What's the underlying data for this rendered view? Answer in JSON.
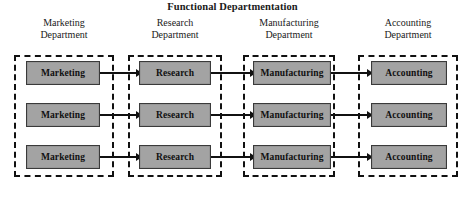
{
  "title": "Functional Departmentation",
  "columns": [
    {
      "id": "marketing",
      "header_line1": "Marketing",
      "header_line2": "Department",
      "unit_label": "Marketing",
      "container_left": 14,
      "container_width": 100,
      "unit_left": 26,
      "unit_width": 74,
      "header_left": 14,
      "header_width": 100,
      "has_outgoing_arrow": true,
      "arrow_left": 100,
      "arrow_width": 42
    },
    {
      "id": "research",
      "header_line1": "Research",
      "header_line2": "Department",
      "unit_label": "Research",
      "container_left": 128,
      "container_width": 94,
      "unit_left": 139,
      "unit_width": 72,
      "header_left": 125,
      "header_width": 100,
      "has_outgoing_arrow": true,
      "arrow_left": 211,
      "arrow_width": 45
    },
    {
      "id": "manufacturing",
      "header_line1": "Manufacturing",
      "header_line2": "Department",
      "unit_label": "Manufacturing",
      "container_left": 243,
      "container_width": 92,
      "unit_left": 253,
      "unit_width": 78,
      "header_left": 239,
      "header_width": 100,
      "has_outgoing_arrow": true,
      "arrow_left": 331,
      "arrow_width": 42
    },
    {
      "id": "accounting",
      "header_line1": "Accounting",
      "header_line2": "Department",
      "unit_label": "Accounting",
      "container_left": 358,
      "container_width": 100,
      "unit_left": 371,
      "unit_width": 76,
      "header_left": 358,
      "header_width": 100,
      "has_outgoing_arrow": false,
      "arrow_left": 0,
      "arrow_width": 0
    }
  ],
  "rows": [
    {
      "index": 0,
      "top": 61
    },
    {
      "index": 1,
      "top": 103
    },
    {
      "index": 2,
      "top": 145
    }
  ],
  "colors": {
    "unit_fill": "#a3a3a3",
    "unit_border": "#3a3a3a",
    "container_border": "#111111",
    "arrow": "#111111",
    "background": "#ffffff",
    "text": "#101010"
  },
  "layout": {
    "container_top": 55,
    "container_height": 122,
    "unit_height": 24,
    "canvas_width": 465,
    "canvas_height": 200
  }
}
